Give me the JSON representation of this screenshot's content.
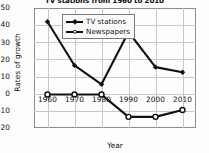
{
  "chart_data": {
    "type": "line",
    "title": "TV stations from 1960 to 2010",
    "xlabel": "Year",
    "ylabel": "Rates of growth",
    "x": [
      1960,
      1970,
      1980,
      1990,
      2000,
      2010
    ],
    "xticklabels": [
      "1960",
      "1970",
      "1980",
      "1990",
      "2000",
      "2010"
    ],
    "yticks": [
      50,
      40,
      30,
      20,
      10,
      0,
      -10,
      -20
    ],
    "yticklabels": [
      "50",
      "40",
      "30",
      "20",
      "10",
      "0",
      "-10",
      "-20"
    ],
    "ylim": [
      -20,
      50
    ],
    "xlim": [
      1955,
      2015
    ],
    "grid": true,
    "legend_position": "upper left inside axes",
    "series": [
      {
        "name": "TV stations",
        "marker": "filled-diamond",
        "color": "#111111",
        "values": [
          42,
          16.5,
          5.5,
          36,
          15.5,
          12.5
        ]
      },
      {
        "name": "Newspapers",
        "marker": "open-circle",
        "color": "#111111",
        "values": [
          -0.5,
          -0.5,
          -0.5,
          -13.5,
          -13.5,
          -9.5
        ]
      }
    ]
  },
  "legend": {
    "items": [
      {
        "label": "TV stations"
      },
      {
        "label": "Newspapers"
      }
    ]
  },
  "colors": {
    "line": "#111111",
    "grid": "#c9c9c9",
    "axis": "#8d8d8d",
    "background": "#fdfdfd",
    "text": "#111111"
  }
}
